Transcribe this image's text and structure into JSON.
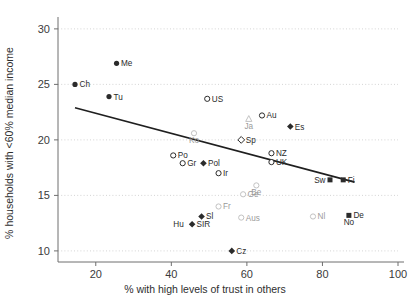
{
  "chart_data": {
    "type": "scatter",
    "title": "",
    "xlabel": "% with high levels of trust in others",
    "ylabel": "% households with <60% median income",
    "xlim": [
      10,
      100
    ],
    "ylim": [
      9,
      30.8
    ],
    "xticks": [
      20,
      40,
      60,
      80,
      100
    ],
    "yticks": [
      10,
      15,
      20,
      25,
      30
    ],
    "grid": "horizontal-dotted",
    "legend": "none",
    "trendline": {
      "label": "linear fit",
      "x_start": 14.5,
      "y_start": 22.9,
      "x_end": 88.5,
      "y_end": 16.2
    },
    "points": [
      {
        "label": "Ch",
        "x": 14.5,
        "y": 25.0,
        "marker": "filled-circle",
        "label_side": "right"
      },
      {
        "label": "Me",
        "x": 25.5,
        "y": 26.9,
        "marker": "filled-circle",
        "label_side": "right"
      },
      {
        "label": "Tu",
        "x": 23.5,
        "y": 23.9,
        "marker": "filled-circle",
        "label_side": "right"
      },
      {
        "label": "US",
        "x": 49.5,
        "y": 23.7,
        "marker": "open-circle",
        "label_side": "right"
      },
      {
        "label": "Ko",
        "x": 46.0,
        "y": 20.6,
        "marker": "faint-circle",
        "label_side": "below"
      },
      {
        "label": "Ja",
        "x": 60.5,
        "y": 21.9,
        "marker": "faint-triangle",
        "label_side": "below"
      },
      {
        "label": "Au",
        "x": 64.0,
        "y": 22.2,
        "marker": "open-circle",
        "label_side": "right"
      },
      {
        "label": "Es",
        "x": 71.5,
        "y": 21.2,
        "marker": "filled-diamond",
        "label_side": "right"
      },
      {
        "label": "Sp",
        "x": 58.5,
        "y": 20.0,
        "marker": "open-diamond",
        "label_side": "right"
      },
      {
        "label": "NZ",
        "x": 66.5,
        "y": 18.8,
        "marker": "open-circle",
        "label_side": "right"
      },
      {
        "label": "UK",
        "x": 66.5,
        "y": 18.0,
        "marker": "open-circle",
        "label_side": "right"
      },
      {
        "label": "Po",
        "x": 40.5,
        "y": 18.6,
        "marker": "open-circle",
        "label_side": "right"
      },
      {
        "label": "Gr",
        "x": 43.0,
        "y": 17.9,
        "marker": "open-circle",
        "label_side": "right"
      },
      {
        "label": "Pol",
        "x": 48.5,
        "y": 17.9,
        "marker": "filled-diamond",
        "label_side": "right"
      },
      {
        "label": "Ir",
        "x": 52.5,
        "y": 17.0,
        "marker": "open-circle",
        "label_side": "right"
      },
      {
        "label": "Be",
        "x": 62.5,
        "y": 15.9,
        "marker": "faint-circle",
        "label_side": "below"
      },
      {
        "label": "Sw",
        "x": 82.0,
        "y": 16.4,
        "marker": "filled-square",
        "label_side": "left"
      },
      {
        "label": "Fi",
        "x": 85.5,
        "y": 16.4,
        "marker": "filled-square",
        "label_side": "right"
      },
      {
        "label": "Ge",
        "x": 59.0,
        "y": 15.1,
        "marker": "faint-circle",
        "label_side": "right"
      },
      {
        "label": "Fr",
        "x": 52.5,
        "y": 14.0,
        "marker": "faint-circle",
        "label_side": "right"
      },
      {
        "label": "Sl",
        "x": 48.0,
        "y": 13.1,
        "marker": "filled-diamond",
        "label_side": "right"
      },
      {
        "label": "Aus",
        "x": 58.5,
        "y": 13.0,
        "marker": "faint-circle",
        "label_side": "right"
      },
      {
        "label": "Nl",
        "x": 77.5,
        "y": 13.1,
        "marker": "faint-circle",
        "label_side": "right"
      },
      {
        "label": "De",
        "x": 87.0,
        "y": 13.2,
        "marker": "filled-square",
        "label_side": "right"
      },
      {
        "label": "No",
        "x": 87.0,
        "y": 13.2,
        "marker": "none",
        "label_side": "below"
      },
      {
        "label": "Hu",
        "x": 44.5,
        "y": 12.4,
        "marker": "none",
        "label_side": "left"
      },
      {
        "label": "SIR",
        "x": 45.5,
        "y": 12.4,
        "marker": "filled-diamond",
        "label_side": "right"
      },
      {
        "label": "Cz",
        "x": 56.0,
        "y": 10.0,
        "marker": "filled-diamond",
        "label_side": "right"
      }
    ]
  }
}
